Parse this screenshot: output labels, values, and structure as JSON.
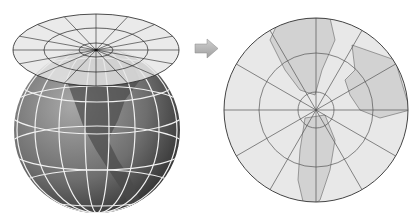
{
  "diagram": {
    "type": "azimuthal-projection-illustration",
    "left_panel": {
      "subject": "globe",
      "projection_plane": "tangent plane at north pole",
      "plane_rings": 3,
      "plane_meridians": 16
    },
    "arrow": {
      "direction": "right",
      "color": "#b5b5b5"
    },
    "right_panel": {
      "subject": "polar azimuthal map",
      "rings": 3,
      "meridians": 12
    },
    "colors": {
      "plane_fill": "#e6e6e6",
      "globe_dark": "#3c3c3c",
      "globe_light": "#9a9a9a",
      "land_globe": "#5a5a5a",
      "graticule_globe": "#f2f2f2",
      "map_ocean": "#e8e8e8",
      "map_land": "#d2d2d2",
      "lines": "#333333"
    }
  }
}
